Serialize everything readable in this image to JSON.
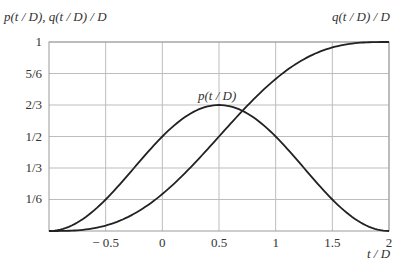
{
  "chart_data": {
    "type": "line",
    "title": "",
    "xlabel": "t / D",
    "ylabel": "p(t / D), q(t / D) / D",
    "xlim": [
      -1,
      2
    ],
    "ylim": [
      0,
      1
    ],
    "grid": true,
    "x_ticks": [
      -0.5,
      0,
      0.5,
      1,
      1.5,
      2
    ],
    "x_tick_labels": [
      "− 0.5",
      "0",
      "0.5",
      "1",
      "1.5",
      "2"
    ],
    "y_ticks": [
      0.1667,
      0.3333,
      0.5,
      0.6667,
      0.8333,
      1
    ],
    "y_tick_labels": [
      "1/6",
      "1/3",
      "1/2",
      "2/3",
      "5/6",
      "1"
    ],
    "series": [
      {
        "name": "p(t / D)",
        "label_position": {
          "x": 0.45,
          "y": 0.74
        },
        "x": [
          -1,
          -0.75,
          -0.5,
          -0.25,
          0,
          0.25,
          0.5,
          0.75,
          1,
          1.25,
          1.5,
          1.75,
          2
        ],
        "values": [
          0,
          0.045,
          0.167,
          0.333,
          0.5,
          0.622,
          0.667,
          0.622,
          0.5,
          0.333,
          0.167,
          0.045,
          0
        ]
      },
      {
        "name": "q(t / D) / D",
        "label_position": {
          "x": 1.85,
          "y": 1.05
        },
        "x": [
          -1,
          -0.75,
          -0.5,
          -0.25,
          0,
          0.25,
          0.5,
          0.75,
          1,
          1.25,
          1.5,
          1.75,
          2
        ],
        "values": [
          0,
          0.004,
          0.029,
          0.091,
          0.196,
          0.337,
          0.5,
          0.663,
          0.804,
          0.909,
          0.971,
          0.996,
          1
        ]
      }
    ]
  },
  "labels": {
    "ylabel": "p(t / D), q(t / D) / D",
    "xlabel": "t / D",
    "p_curve": "p(t / D)",
    "q_curve": "q(t / D) / D"
  }
}
